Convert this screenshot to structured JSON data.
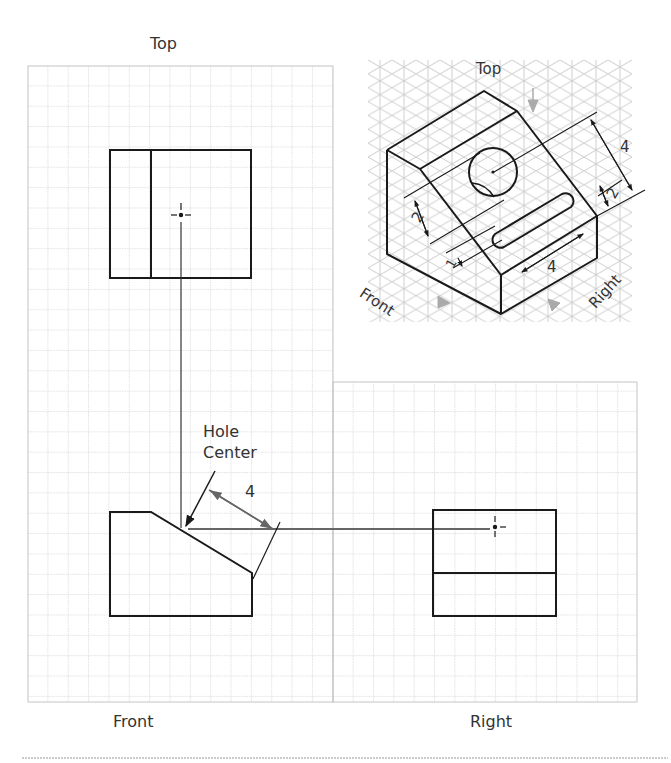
{
  "figure": {
    "type": "orthographic projection exercise",
    "labels": {
      "top_view": "Top",
      "front_view": "Front",
      "right_view": "Right",
      "hole_center": [
        "Hole",
        "Center"
      ],
      "front_dimension": "4"
    },
    "isometric": {
      "labels": {
        "top": "Top",
        "front": "Front",
        "right": "Right"
      },
      "dimensions": {
        "hole_to_edge": "4",
        "slot_offset_right": "2",
        "hole_offset_left": "2",
        "slot_width": "1",
        "slot_length": "4"
      }
    },
    "grid": {
      "cell_size_px": 20.4,
      "grid_color": "#bdbdbd",
      "line_color": "#1a1a1a",
      "projection_color": "#555555"
    }
  }
}
